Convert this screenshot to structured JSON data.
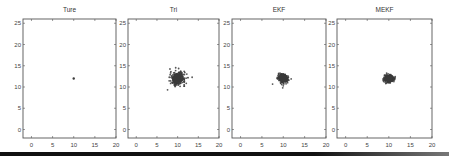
{
  "chart_data": [
    {
      "type": "scatter",
      "title": "Ture",
      "xlim": [
        -2,
        20
      ],
      "ylim": [
        -2,
        26
      ],
      "xticks": [
        0,
        5,
        10,
        15,
        20
      ],
      "yticks": [
        0,
        5,
        10,
        15,
        20,
        25
      ],
      "cluster": {
        "cx": 10,
        "cy": 12,
        "rx": 0.15,
        "ry": 0.2,
        "density": "single point"
      }
    },
    {
      "type": "scatter",
      "title": "Tri",
      "xlim": [
        -2,
        20
      ],
      "ylim": [
        -2,
        26
      ],
      "xticks": [
        0,
        5,
        10,
        15,
        20
      ],
      "yticks": [
        0,
        5,
        10,
        15,
        20,
        25
      ],
      "cluster": {
        "cx": 10,
        "cy": 12,
        "rx": 2.0,
        "ry": 1.7,
        "outlier": [
          12.5,
          12.2
        ]
      }
    },
    {
      "type": "scatter",
      "title": "EKF",
      "xlim": [
        -2,
        20
      ],
      "ylim": [
        -2,
        26
      ],
      "xticks": [
        0,
        5,
        10,
        15,
        20
      ],
      "yticks": [
        0,
        5,
        10,
        15,
        20,
        25
      ],
      "cluster": {
        "cx": 10,
        "cy": 12,
        "rx": 1.3,
        "ry": 1.2
      }
    },
    {
      "type": "scatter",
      "title": "MEKF",
      "xlim": [
        -2,
        20
      ],
      "ylim": [
        -2,
        26
      ],
      "xticks": [
        0,
        5,
        10,
        15,
        20
      ],
      "yticks": [
        0,
        5,
        10,
        15,
        20,
        25
      ],
      "cluster": {
        "cx": 10,
        "cy": 12,
        "rx": 1.2,
        "ry": 1.0
      }
    }
  ],
  "layout": {
    "panels_x": [
      [
        23,
        116
      ],
      [
        128,
        219
      ],
      [
        232,
        326
      ],
      [
        337,
        432
      ]
    ],
    "plot_top": 19,
    "plot_bottom": 138,
    "point_color": "#3a3a3a",
    "axis_color": "#555555"
  }
}
